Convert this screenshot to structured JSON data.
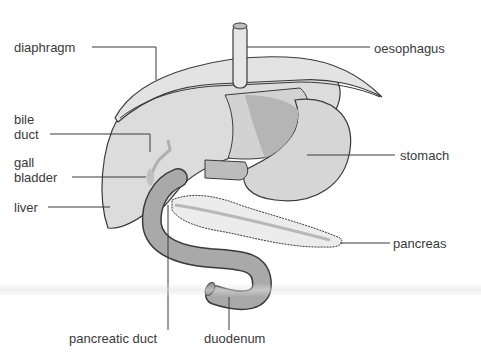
{
  "diagram": {
    "type": "anatomical-labeled-illustration",
    "colors": {
      "background": "#ffffff",
      "organ_light": "#dcdcdc",
      "organ_mid": "#c8c8c8",
      "organ_dark": "#a9a9a9",
      "outline": "#3a3a3a",
      "label_text": "#3a3a3a"
    },
    "labels": {
      "diaphragm": "diaphragm",
      "bile_duct_line1": "bile",
      "bile_duct_line2": "duct",
      "gall_bladder_line1": "gall",
      "gall_bladder_line2": "bladder",
      "liver": "liver",
      "oesophagus": "oesophagus",
      "stomach": "stomach",
      "pancreas": "pancreas",
      "pancreatic_duct": "pancreatic duct",
      "duodenum": "duodenum"
    }
  }
}
